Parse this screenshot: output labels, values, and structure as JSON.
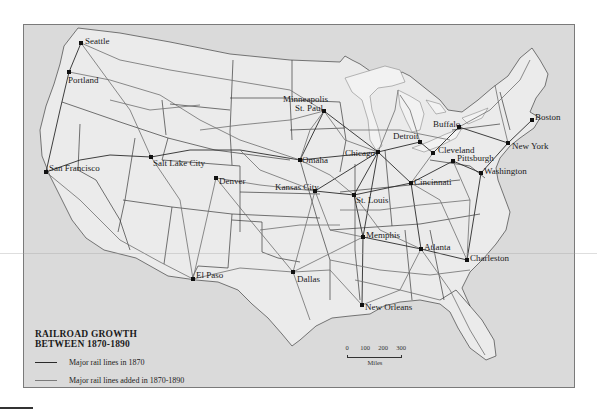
{
  "map": {
    "title_line1": "RAILROAD GROWTH",
    "title_line2": "BETWEEN 1870-1890",
    "colors": {
      "ocean": "#dadada",
      "land": "#ebebeb",
      "lakes": "#f2f2f2",
      "rail_1870": "#2a2a2a",
      "rail_added": "#6e6e6e",
      "borders": "#3a3a3a"
    },
    "legend": [
      {
        "label": "Major rail lines in 1870",
        "color": "#2a2a2a"
      },
      {
        "label": "Major rail lines added in 1870-1890",
        "color": "#7a7a7a"
      }
    ],
    "scale": {
      "ticks": [
        "0",
        "100",
        "200",
        "300"
      ],
      "unit": "Miles"
    },
    "cities": [
      {
        "name": "Seattle",
        "x": 81,
        "y": 43,
        "lx": 85,
        "ly": 36
      },
      {
        "name": "Portland",
        "x": 69,
        "y": 72,
        "lx": 68,
        "ly": 75
      },
      {
        "name": "San Francisco",
        "x": 46,
        "y": 172,
        "lx": 49,
        "ly": 163
      },
      {
        "name": "Salt Lake City",
        "x": 151,
        "y": 157,
        "lx": 153,
        "ly": 158
      },
      {
        "name": "Denver",
        "x": 216,
        "y": 178,
        "lx": 219,
        "ly": 176
      },
      {
        "name": "El Paso",
        "x": 193,
        "y": 279,
        "lx": 196,
        "ly": 270
      },
      {
        "name": "Minneapolis",
        "x": 0,
        "y": 0,
        "lx": 283,
        "ly": 94
      },
      {
        "name": "St. Paul",
        "x": 324,
        "y": 111,
        "lx": 295,
        "ly": 103
      },
      {
        "name": "Omaha",
        "x": 300,
        "y": 160,
        "lx": 302,
        "ly": 155
      },
      {
        "name": "Kansas City",
        "x": 315,
        "y": 191,
        "lx": 275,
        "ly": 182
      },
      {
        "name": "Dallas",
        "x": 293,
        "y": 272,
        "lx": 297,
        "ly": 274
      },
      {
        "name": "St. Louis",
        "x": 354,
        "y": 195,
        "lx": 356,
        "ly": 195
      },
      {
        "name": "Chicago",
        "x": 378,
        "y": 152,
        "lx": 345,
        "ly": 148
      },
      {
        "name": "Detroit",
        "x": 420,
        "y": 142,
        "lx": 393,
        "ly": 131
      },
      {
        "name": "Buffalo",
        "x": 459,
        "y": 127,
        "lx": 433,
        "ly": 119
      },
      {
        "name": "Cleveland",
        "x": 433,
        "y": 153,
        "lx": 438,
        "ly": 145
      },
      {
        "name": "Pittsburgh",
        "x": 453,
        "y": 161,
        "lx": 457,
        "ly": 153
      },
      {
        "name": "Washington",
        "x": 481,
        "y": 173,
        "lx": 484,
        "ly": 166
      },
      {
        "name": "New York",
        "x": 508,
        "y": 143,
        "lx": 512,
        "ly": 141
      },
      {
        "name": "Boston",
        "x": 532,
        "y": 120,
        "lx": 535,
        "ly": 112
      },
      {
        "name": "Cincinnati",
        "x": 411,
        "y": 183,
        "lx": 414,
        "ly": 177
      },
      {
        "name": "Memphis",
        "x": 363,
        "y": 237,
        "lx": 366,
        "ly": 230
      },
      {
        "name": "Atlanta",
        "x": 421,
        "y": 249,
        "lx": 424,
        "ly": 242
      },
      {
        "name": "Charleston",
        "x": 467,
        "y": 260,
        "lx": 470,
        "ly": 253
      },
      {
        "name": "New Orleans",
        "x": 362,
        "y": 305,
        "lx": 365,
        "ly": 302
      }
    ]
  }
}
